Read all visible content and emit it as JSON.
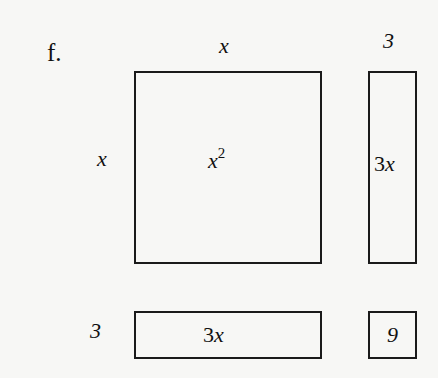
{
  "problem": {
    "label": "f.",
    "top_labels": {
      "square_width": "x",
      "strip_width": "3"
    },
    "side_labels": {
      "square_height": "x",
      "strip_height": "3"
    },
    "tiles": {
      "square": {
        "coef": "x",
        "exp": "2"
      },
      "vertical_strip": {
        "coef": "3",
        "var": "x"
      },
      "horizontal_strip": {
        "coef": "3",
        "var": "x"
      },
      "unit_square": {
        "value": "9"
      }
    }
  }
}
